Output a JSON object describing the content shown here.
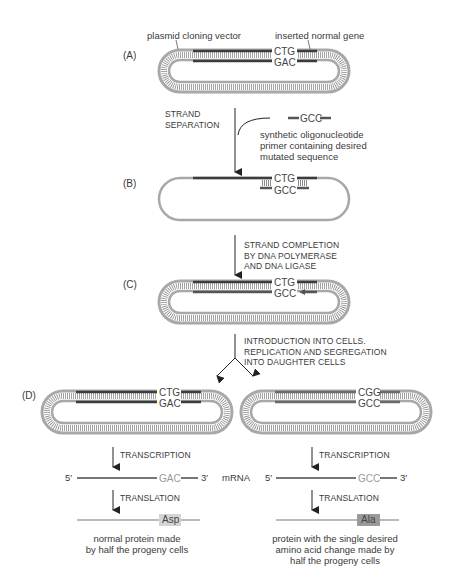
{
  "labels": {
    "plasmid_vector": "plasmid cloning vector",
    "inserted_gene": "inserted normal gene"
  },
  "panels": {
    "A": "(A)",
    "B": "(B)",
    "C": "(C)",
    "D": "(D)"
  },
  "steps": {
    "strand_separation": [
      "STRAND",
      "SEPARATION"
    ],
    "strand_completion": [
      "STRAND COMPLETION",
      "BY DNA POLYMERASE",
      "AND DNA LIGASE"
    ],
    "introduction": [
      "INTRODUCTION INTO CELLS.",
      "REPLICATION AND SEGREGATION",
      "INTO DAUGHTER CELLS"
    ],
    "transcription": "TRANSCRIPTION",
    "translation": "TRANSLATION"
  },
  "primer": {
    "sequence": "GCC",
    "description": [
      "synthetic oligonucleotide",
      "primer containing desired",
      "mutated sequence"
    ]
  },
  "sequences": {
    "A_top": "CTG",
    "A_bottom": "GAC",
    "B_top": "CTG",
    "B_bottom": "GCC",
    "C_top": "CTG",
    "C_bottom": "GCC",
    "D_left_top": "CTG",
    "D_left_bottom": "GAC",
    "D_right_top": "CGG",
    "D_right_bottom": "GCC"
  },
  "mrna": {
    "label": "mRNA",
    "five_prime": "5′",
    "three_prime": "3′",
    "left_codon": "GAC",
    "right_codon": "GCC"
  },
  "proteins": {
    "left_residue": "Asp",
    "right_residue": "Ala",
    "left_description": [
      "normal protein made",
      "by half the progeny cells"
    ],
    "right_description": [
      "protein with the single desired",
      "amino acid change made by",
      "half the progeny cells"
    ]
  },
  "colors": {
    "plasmid": "#a8a8a8",
    "gene": "#3c3c3c",
    "rungs": "#8a8a8a",
    "background": "#ffffff",
    "asp_box": "#d4d4d4",
    "ala_box": "#9a9a9a"
  }
}
